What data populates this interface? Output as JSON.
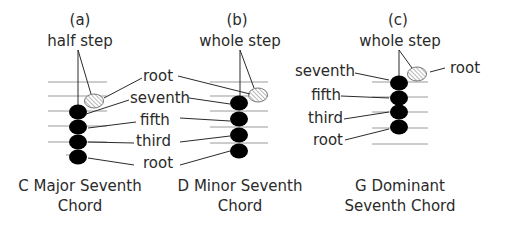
{
  "panels": [
    {
      "id": "a",
      "tag": "(a)",
      "interval": "half step",
      "labels": [
        "root",
        "seventh",
        "fifth",
        "third",
        "root"
      ],
      "caption_line1": "C Major Seventh",
      "caption_line2": "Chord"
    },
    {
      "id": "b",
      "tag": "(b)",
      "interval": "whole step",
      "labels": [
        "root",
        "seventh",
        "fifth",
        "third",
        "root"
      ],
      "caption_line1": "D Minor Seventh",
      "caption_line2": "Chord"
    },
    {
      "id": "c",
      "tag": "(c)",
      "interval": "whole step",
      "labels": [
        "seventh",
        "fifth",
        "third",
        "root",
        "root"
      ],
      "caption_line1": "G Dominant",
      "caption_line2": "Seventh Chord"
    }
  ],
  "legend": {
    "filled_note": "chord tone",
    "hatched_note": "root (octave) above seventh"
  }
}
